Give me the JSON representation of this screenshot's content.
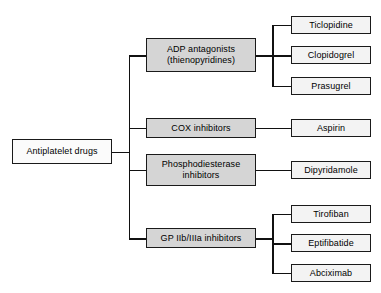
{
  "diagram": {
    "type": "hierarchy-tree",
    "orientation": "left-to-right",
    "colors": {
      "background": "#ffffff",
      "line": "#111111",
      "border": "#1a1a1a",
      "root_fill": "#fbfbfb",
      "level2_fill": "#d5d5d5",
      "leaf_fill": "#f3f3f3"
    },
    "root": {
      "label": "Antiplatelet drugs"
    },
    "branches": [
      {
        "label": "ADP antagonists\n(thienopyridines)",
        "children": [
          {
            "label": "Ticlopidine"
          },
          {
            "label": "Clopidogrel"
          },
          {
            "label": "Prasugrel"
          }
        ]
      },
      {
        "label": "COX inhibitors",
        "children": [
          {
            "label": "Aspirin"
          }
        ]
      },
      {
        "label": "Phosphodiesterase\ninhibitors",
        "children": [
          {
            "label": "Dipyridamole"
          }
        ]
      },
      {
        "label": "GP IIb/IIIa inhibitors",
        "children": [
          {
            "label": "Tirofiban"
          },
          {
            "label": "Eptifibatide"
          },
          {
            "label": "Abciximab"
          }
        ]
      }
    ]
  }
}
